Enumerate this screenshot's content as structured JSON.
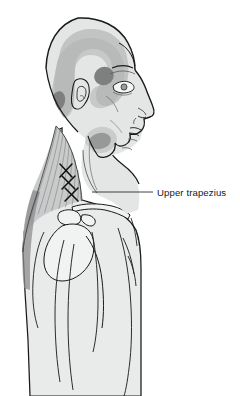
{
  "figure": {
    "view": "right lateral profile"
  },
  "labels": [
    {
      "id": "upper-trapezius",
      "text": "Upper trapezius",
      "text_x": 157,
      "text_y": 196,
      "leader_from_x": 153,
      "leader_from_y": 192,
      "leader_to_x": 92,
      "leader_to_y": 192
    }
  ],
  "colors": {
    "outline": "#1a1a1a",
    "body_fill": "#e9eaea",
    "head_fill": "#e4e5e5",
    "referred_pain_light": "#c2c3c3",
    "referred_pain_medium": "#b0b1b1",
    "essential_zone_dark": "#7e7f7f",
    "muscle_fill": "#c9cacb",
    "muscle_shadow": "#8d8e8f",
    "bone_fill": "#f1f2f2",
    "label_color": "#1a1a1a",
    "background": "#ffffff"
  },
  "pain_zones": [
    {
      "id": "spread-band-head",
      "name": "referred pain spillover band",
      "shade": "light",
      "region": "temporal to occipital arc"
    },
    {
      "id": "essential-temple",
      "name": "essential zone at temple and eyebrow",
      "shade": "dark",
      "region": "lateral orbit / temple"
    },
    {
      "id": "essential-occiput",
      "name": "essential zone at posterolateral occiput",
      "shade": "dark",
      "region": "occiput behind ear"
    },
    {
      "id": "essential-angle-jaw",
      "name": "essential zone at angle of jaw",
      "shade": "dark",
      "region": "mandibular angle"
    }
  ],
  "trigger_points": {
    "marker": "X",
    "count": 3,
    "muscle": "Upper trapezius",
    "positions": [
      {
        "cx": 66,
        "cy": 171
      },
      {
        "cx": 69,
        "cy": 182
      },
      {
        "cx": 72,
        "cy": 193
      }
    ]
  },
  "anatomy_parts": [
    {
      "id": "cranium",
      "name": "cranium"
    },
    {
      "id": "face-profile",
      "name": "facial profile"
    },
    {
      "id": "ear",
      "name": "external ear"
    },
    {
      "id": "eye",
      "name": "eye"
    },
    {
      "id": "nose",
      "name": "nose"
    },
    {
      "id": "lips",
      "name": "lips"
    },
    {
      "id": "chin",
      "name": "chin"
    },
    {
      "id": "neck",
      "name": "neck"
    },
    {
      "id": "trapezius",
      "name": "upper trapezius muscle"
    },
    {
      "id": "clavicle",
      "name": "clavicle"
    },
    {
      "id": "scapula-spine",
      "name": "spine of scapula and acromion"
    },
    {
      "id": "humerus",
      "name": "humerus head"
    },
    {
      "id": "torso",
      "name": "upper torso"
    },
    {
      "id": "arm",
      "name": "upper arm"
    }
  ]
}
